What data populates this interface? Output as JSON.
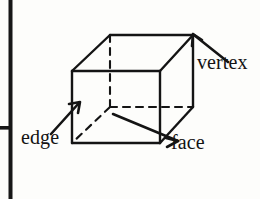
{
  "figure": {
    "background_color": "#fdfdfb",
    "ink_color": "#141414",
    "labels": {
      "vertex": "vertex",
      "edge": "edge",
      "face": "face"
    },
    "shape": {
      "name": "cube",
      "front_face": {
        "top_left": [
          72,
          71
        ],
        "top_right": [
          160,
          71
        ],
        "bottom_right": [
          160,
          143
        ],
        "bottom_left": [
          72,
          143
        ]
      },
      "back_face": {
        "top_left": [
          110,
          35
        ],
        "top_right": [
          193,
          35
        ],
        "bottom_right": [
          193,
          107
        ],
        "bottom_left": [
          110,
          107
        ]
      },
      "hidden_vertex": [
        110,
        107
      ],
      "hidden_edges": [
        "back-bottom-left to back-top-left",
        "back-bottom-left to back-bottom-right",
        "back-bottom-left to front-bottom-left"
      ]
    },
    "leaders": {
      "vertex": {
        "from": [
          228,
          62
        ],
        "to": [
          193,
          35
        ],
        "arrowhead": true
      },
      "edge": {
        "from": [
          52,
          133
        ],
        "to": [
          79,
          103
        ],
        "arrowhead": true
      },
      "face": {
        "from": [
          177,
          140
        ],
        "to": [
          113,
          114
        ],
        "arrowhead": true
      }
    },
    "crop_marks": {
      "left_rule": {
        "x": 10,
        "y1": 0,
        "y2": 199,
        "width": 4
      },
      "tick_rule": {
        "y": 128,
        "x1": 0,
        "x2": 12,
        "height": 4
      }
    }
  }
}
